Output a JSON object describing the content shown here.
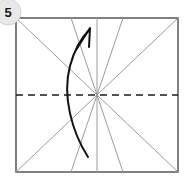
{
  "figure": {
    "kind": "origami-instruction-diagram",
    "background_color": "#ffffff",
    "width": 186,
    "height": 181
  },
  "step_badge": {
    "label": "5",
    "shape": "circle",
    "fill_color": "#e8e8e8",
    "edge_color": "#d2d2d2",
    "text_color": "#1a1a1a",
    "center_x": 8,
    "center_y": 12,
    "radius": 13,
    "clipped_at_left_edge": true
  },
  "paper": {
    "name": "square-sheet",
    "stroke_color": "#3c3c3c",
    "fill_color": "#ffffff",
    "left": 16,
    "top": 18,
    "right": 178,
    "bottom": 172,
    "stroke_width": 1.3
  },
  "center_point": {
    "x": 97,
    "y": 95
  },
  "creases": {
    "valley_fold_color": "#1a1a1a",
    "existing_crease_color": "#9b9b9b",
    "dashed_pattern": "7 5",
    "horizontal_dashed": {
      "name": "horizontal-valley-crease",
      "x1": 16,
      "y1": 95,
      "x2": 178,
      "y2": 95,
      "style": "dashed",
      "color": "#1a1a1a",
      "width": 1.4
    },
    "vertical_solid": {
      "name": "vertical-crease",
      "x1": 97,
      "y1": 18,
      "x2": 97,
      "y2": 172,
      "style": "solid",
      "color": "#9b9b9b",
      "width": 1.0
    },
    "radiating": [
      {
        "name": "crease-diagonal-tl-br",
        "x1": 16,
        "y1": 18,
        "x2": 178,
        "y2": 172
      },
      {
        "name": "crease-diagonal-bl-tr",
        "x1": 16,
        "y1": 172,
        "x2": 178,
        "y2": 18
      },
      {
        "name": "crease-center-to-top-left",
        "x1": 97,
        "y1": 95,
        "x2": 71,
        "y2": 18
      },
      {
        "name": "crease-center-to-top-right",
        "x1": 97,
        "y1": 95,
        "x2": 123,
        "y2": 18
      },
      {
        "name": "crease-center-to-bottom-left",
        "x1": 97,
        "y1": 95,
        "x2": 71,
        "y2": 172
      },
      {
        "name": "crease-center-to-bottom-right",
        "x1": 97,
        "y1": 95,
        "x2": 123,
        "y2": 172
      }
    ]
  },
  "fold_arrow": {
    "name": "fold-direction-arrow",
    "color": "#111111",
    "width": 2.0,
    "start_x": 88,
    "start_y": 157,
    "end_x": 90,
    "end_y": 29,
    "curve_path": "M 88 157 C 72 132, 62 96, 70 66 C 75 47, 84 35, 90 29",
    "arrowhead": {
      "tip_x": 90,
      "tip_y": 28,
      "left_x": 76,
      "left_y": 50,
      "right_x": 89,
      "right_y": 47
    },
    "meaning": "fold bottom edge up along horizontal crease"
  }
}
